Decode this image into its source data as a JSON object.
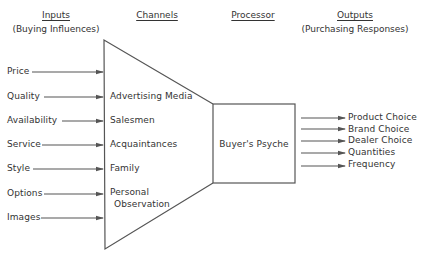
{
  "headers": {
    "inputs": {
      "title": "Inputs",
      "subtitle": "(Buying Influences)"
    },
    "channels": {
      "title": "Channels"
    },
    "processor": {
      "title": "Processor"
    },
    "outputs": {
      "title": "Outputs",
      "subtitle": "(Purchasing Responses)"
    }
  },
  "inputs": [
    "Price",
    "Quality",
    "Availability",
    "Service",
    "Style",
    "Options",
    "Images"
  ],
  "channels": [
    "Advertising Media",
    "Salesmen",
    "Acquaintances",
    "Family",
    "Personal",
    "Observation"
  ],
  "processor": {
    "label": "Buyer's Psyche"
  },
  "outputs": [
    "Product Choice",
    "Brand Choice",
    "Dealer Choice",
    "Quantities",
    "Frequency"
  ],
  "colors": {
    "line": "#555555",
    "text": "#333333",
    "background": "#ffffff"
  }
}
